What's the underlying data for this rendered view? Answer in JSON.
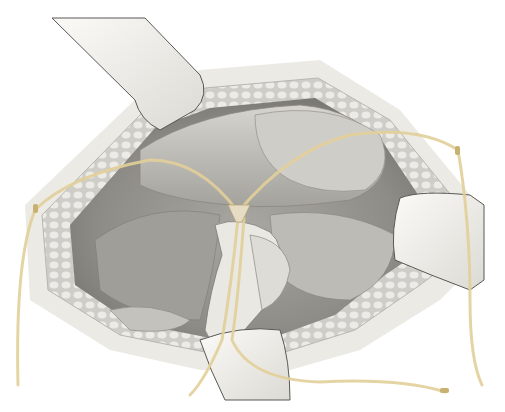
{
  "image": {
    "description": "Surgical illustration of an open abdominal incision held by retractors, with yellow vessel loops / drains passing through the operative field",
    "alt": "Surgical illustration: retracted abdominal incision with vessel loops"
  },
  "colors": {
    "background": "#ffffff",
    "skin_edge": "#e4e2dc",
    "fat_layer": "#d8d6d0",
    "cavity_dark": "#8c8a84",
    "organ_mid": "#b4b2ac",
    "organ_light": "#d2d0ca",
    "retractor": "#f0efeb",
    "retractor_edge": "#5a5854",
    "vessel_loop": "#e3d09a",
    "vessel_loop_dark": "#c8b070"
  }
}
